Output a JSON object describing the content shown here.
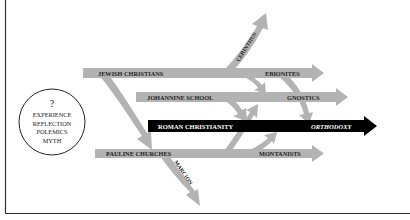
{
  "colors": {
    "arrow_gray": "#b3b3b3",
    "main_black": "#000000",
    "text_dark": "#222222",
    "text_white": "#ffffff",
    "frame": "#333333"
  },
  "circle": {
    "mark": "?",
    "lines": [
      "EXPERIENCE",
      "REFLECTION",
      "POLEMICS",
      "MYTH"
    ]
  },
  "streams": {
    "jewish_christians": {
      "label": "JEWISH CHRISTIANS",
      "end_label": "EBIONITES"
    },
    "johannine_school": {
      "label": "JOHANNINE SCHOOL",
      "end_label": "GNOSTICS"
    },
    "roman_christianity": {
      "label": "ROMAN CHRISTIANITY",
      "end_label": "ORTHODOXY"
    },
    "pauline_churches": {
      "label": "PAULINE CHURCHES",
      "end_label": "MONTANISTS"
    }
  },
  "branches": {
    "cerinthus": {
      "label": "CERINTHUS"
    },
    "marcion": {
      "label": "MARCION"
    }
  }
}
